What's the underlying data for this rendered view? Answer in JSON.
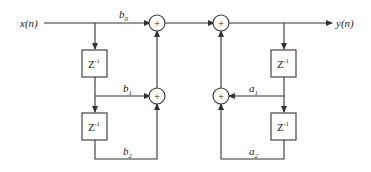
{
  "diagram": {
    "type": "IIR Direct Form I block diagram",
    "input_label": "x(n)",
    "output_label": "y(n)",
    "feedforward_coefficients": [
      {
        "name": "b",
        "sub": "0"
      },
      {
        "name": "b",
        "sub": "1"
      },
      {
        "name": "b",
        "sub": "2"
      }
    ],
    "feedback_coefficients": [
      {
        "name": "a",
        "sub": "1"
      },
      {
        "name": "a",
        "sub": "2"
      }
    ],
    "delay_label": {
      "base": "Z",
      "exp": "-1"
    },
    "adder_symbol": "+",
    "colors": {
      "line": "#333333",
      "background": "#ffffff"
    }
  }
}
